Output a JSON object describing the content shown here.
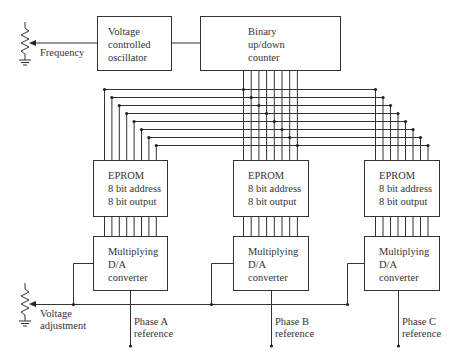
{
  "diagram": {
    "colors": {
      "line": "#333333",
      "text": "#333333",
      "background": "#ffffff"
    },
    "inputs": {
      "frequency": {
        "label": "Frequency",
        "icon": "potentiometer-icon"
      },
      "voltage": {
        "label_line1": "Voltage",
        "label_line2": "adjustment",
        "icon": "potentiometer-icon"
      }
    },
    "vco": {
      "line1": "Voltage",
      "line2": "controlled",
      "line3": "oscillator"
    },
    "counter": {
      "line1": "Binary",
      "line2": "up/down",
      "line3": "counter"
    },
    "eproms": [
      {
        "line1": "EPROM",
        "line2": "8 bit address",
        "line3": "8 bit output"
      },
      {
        "line1": "EPROM",
        "line2": "8 bit address",
        "line3": "8 bit output"
      },
      {
        "line1": "EPROM",
        "line2": "8 bit address",
        "line3": "8 bit output"
      }
    ],
    "dacs": [
      {
        "line1": "Multiplying",
        "line2": "D/A",
        "line3": "converter"
      },
      {
        "line1": "Multiplying",
        "line2": "D/A",
        "line3": "converter"
      },
      {
        "line1": "Multiplying",
        "line2": "D/A",
        "line3": "converter"
      }
    ],
    "outputs": [
      {
        "line1": "Phase A",
        "line2": "reference"
      },
      {
        "line1": "Phase B",
        "line2": "reference"
      },
      {
        "line1": "Phase C",
        "line2": "reference"
      }
    ],
    "bus_width_bits": 8
  }
}
